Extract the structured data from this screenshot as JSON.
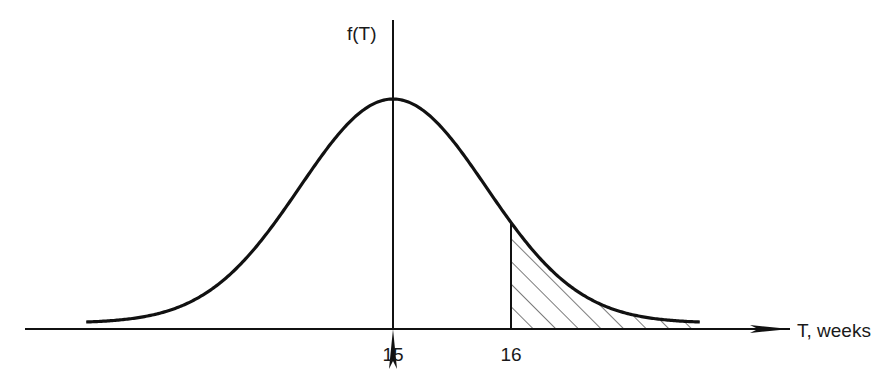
{
  "chart_data": {
    "type": "line",
    "title": "",
    "xlabel": "T, weeks",
    "ylabel": "f(T)",
    "distribution": "normal",
    "mean": 15,
    "std_dev": 0.79,
    "x_range": [
      12.4,
      17.6
    ],
    "xlim": [
      11.8,
      18.3
    ],
    "x_ticks": [
      15,
      16
    ],
    "x_tick_labels": [
      "15",
      "16"
    ],
    "shaded_region": {
      "from": 16,
      "to": 17.6,
      "pattern": "diagonal-hatch",
      "meaning": "P(T > 16)"
    },
    "vertical_line_at": 15,
    "grid": false,
    "legend": "none",
    "colors": {
      "line": "#111111",
      "background": "#ffffff"
    }
  }
}
